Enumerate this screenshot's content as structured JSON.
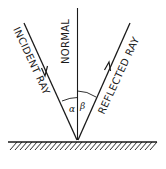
{
  "diagram": {
    "labels": {
      "normal": "NORMAL",
      "incident_ray": "INCIDENT RAY",
      "reflected_ray": "REFLECTED RAY",
      "angle_incidence": "α",
      "angle_reflection": "β"
    },
    "colors": {
      "line": "#1a1a1a",
      "background": "#ffffff"
    }
  }
}
